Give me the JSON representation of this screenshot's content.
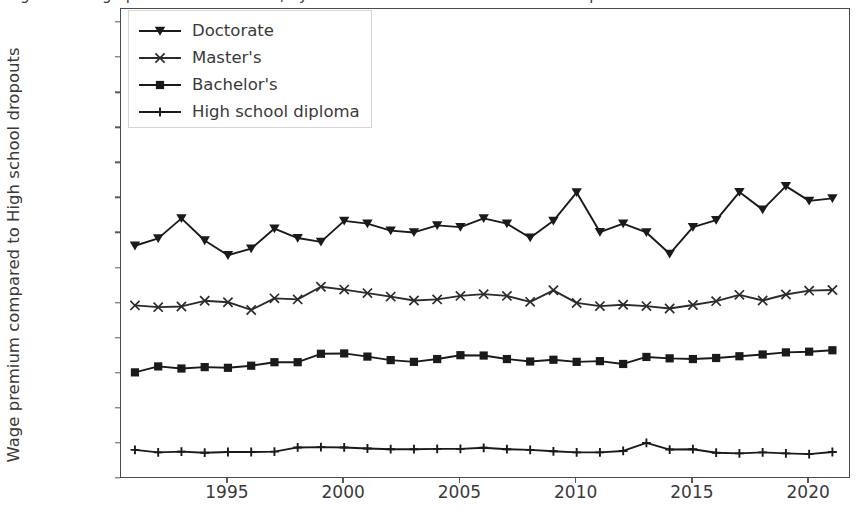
{
  "chart_data": {
    "type": "line",
    "title": "Figure 3. Wage premiums over time, by education attainment relative to dropouts",
    "xlabel": "",
    "ylabel": "Wage premium compared to High school dropouts",
    "xlim": [
      1990.4,
      2021.8
    ],
    "ylim": [
      0,
      134000
    ],
    "grid": false,
    "legend_position": "upper-left-inside",
    "x": [
      1991,
      1992,
      1993,
      1994,
      1995,
      1996,
      1997,
      1998,
      1999,
      2000,
      2001,
      2002,
      2003,
      2004,
      2005,
      2006,
      2007,
      2008,
      2009,
      2010,
      2011,
      2012,
      2013,
      2014,
      2015,
      2016,
      2017,
      2018,
      2019,
      2020,
      2021
    ],
    "xticks": [
      1995,
      2000,
      2005,
      2010,
      2015,
      2020
    ],
    "xticklabels": [
      "1995",
      "2000",
      "2005",
      "2010",
      "2015",
      "2020"
    ],
    "yticks": [
      0,
      10000,
      20000,
      30000,
      40000,
      50000,
      60000,
      70000,
      80000,
      90000,
      100000,
      110000,
      120000,
      130000
    ],
    "yticklabels": [
      "0",
      "10,000",
      "20,000",
      "30,000",
      "40,000",
      "50,000",
      "60,000",
      "70,000",
      "80,000",
      "90,000",
      "100,000",
      "110,000",
      "120,000",
      "130,000"
    ],
    "series": [
      {
        "name": "Doctorate",
        "marker": "triangle-down",
        "color": "#1a1a1a",
        "values": [
          66500,
          68600,
          74300,
          68000,
          63800,
          65700,
          71400,
          68700,
          67600,
          73600,
          72800,
          70800,
          70300,
          72300,
          71800,
          74300,
          72800,
          68800,
          73600,
          81700,
          70400,
          72800,
          70300,
          64200,
          71800,
          73800,
          81800,
          76800,
          83500,
          79300,
          80000
        ]
      },
      {
        "name": "Master's",
        "marker": "x",
        "color": "#2b2b2b",
        "values": [
          49500,
          49000,
          49200,
          50800,
          50400,
          48200,
          51500,
          51200,
          54800,
          54000,
          53000,
          52000,
          50900,
          51200,
          52200,
          52700,
          52200,
          50500,
          53800,
          50200,
          49300,
          49700,
          49300,
          48600,
          49600,
          50700,
          52500,
          50900,
          52600,
          53700,
          53900
        ]
      },
      {
        "name": "Bachelor's",
        "marker": "square",
        "color": "#1a1a1a",
        "values": [
          30400,
          32100,
          31500,
          31900,
          31700,
          32300,
          33300,
          33300,
          35700,
          35800,
          34900,
          33900,
          33400,
          34200,
          35300,
          35200,
          34200,
          33500,
          34000,
          33400,
          33600,
          32800,
          34800,
          34400,
          34200,
          34500,
          35000,
          35500,
          36100,
          36300,
          36700
        ]
      },
      {
        "name": "High school diploma",
        "marker": "plus",
        "color": "#1a1a1a",
        "values": [
          8300,
          7600,
          7800,
          7500,
          7700,
          7700,
          7800,
          9000,
          9100,
          9000,
          8700,
          8500,
          8500,
          8600,
          8600,
          8900,
          8500,
          8300,
          7900,
          7600,
          7600,
          8000,
          10300,
          8400,
          8500,
          7500,
          7300,
          7600,
          7300,
          7100,
          7700
        ]
      }
    ]
  },
  "legend": {
    "items": [
      {
        "label": "Doctorate"
      },
      {
        "label": "Master's"
      },
      {
        "label": "Bachelor's"
      },
      {
        "label": "High school diploma"
      }
    ]
  }
}
